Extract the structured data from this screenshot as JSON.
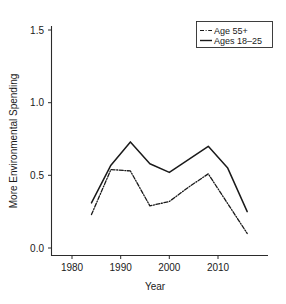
{
  "chart_data": {
    "type": "line",
    "title": "",
    "subtitle": "",
    "xlabel": "Year",
    "ylabel": "More Environmental Spending",
    "xlim": [
      1978,
      2018
    ],
    "ylim": [
      0.0,
      1.6
    ],
    "xticks": [
      1980,
      1990,
      2000,
      2010
    ],
    "xtick_labels": [
      "1980",
      "1990",
      "2000",
      "2010"
    ],
    "yticks": [
      0.0,
      0.5,
      1.0,
      1.5
    ],
    "ytick_labels": [
      "0.0",
      "0.5",
      "1.0",
      "1.5"
    ],
    "grid": false,
    "legend_position": "top-right",
    "series": [
      {
        "name": "Age 55+",
        "style": "dash-dot",
        "color": "#1a1a1a",
        "x": [
          1984,
          1988,
          1992,
          1996,
          2000,
          2004,
          2008,
          2016
        ],
        "values": [
          0.23,
          0.54,
          0.53,
          0.29,
          0.32,
          0.42,
          0.51,
          0.1
        ]
      },
      {
        "name": "Ages 18–25",
        "style": "solid",
        "color": "#1a1a1a",
        "x": [
          1984,
          1988,
          1992,
          1996,
          2000,
          2008,
          2012,
          2016
        ],
        "values": [
          0.31,
          0.57,
          0.73,
          0.58,
          0.52,
          0.7,
          0.55,
          0.25
        ]
      }
    ]
  },
  "axes": {
    "y_title": "More Environmental Spending",
    "x_title": "Year",
    "y_tick_0": "0.0",
    "y_tick_1": "0.5",
    "y_tick_2": "1.0",
    "y_tick_3": "1.5",
    "x_tick_0": "1980",
    "x_tick_1": "1990",
    "x_tick_2": "2000",
    "x_tick_3": "2010"
  },
  "legend": {
    "entry_0_label": "Age 55+",
    "entry_1_label": "Ages 18–25"
  }
}
